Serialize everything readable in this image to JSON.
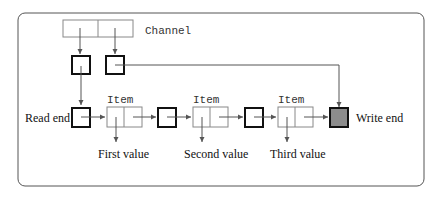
{
  "diagram": {
    "channel_label": "Channel",
    "read_end_label": "Read end",
    "write_end_label": "Write end",
    "items": [
      {
        "label": "Item",
        "value_label": "First value"
      },
      {
        "label": "Item",
        "value_label": "Second value"
      },
      {
        "label": "Item",
        "value_label": "Third value"
      }
    ],
    "colors": {
      "frame": "#555555",
      "thin_box": "#888888",
      "thick_box": "#111111",
      "write_end_fill": "#8c8c8c",
      "arrow": "#555555"
    }
  }
}
